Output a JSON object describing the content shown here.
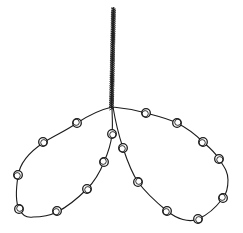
{
  "figure": {
    "background_color": "#ffffff",
    "ink_color": "#1c1c1c",
    "canvas": {
      "width": 243,
      "height": 233
    },
    "stem": {
      "x_top": 113.5,
      "y_top": 8,
      "x_bottom": 111.5,
      "y_bottom": 107,
      "width": 4,
      "texture": "twisted-cord"
    },
    "loops": [
      {
        "name": "left-loop",
        "bead_count": 8,
        "path": "M 112 107 C 99 110 86 117 77 123 C 64 132 53 136 43 143 C 31 151 20 162 18 176 C 16 189 15 201 19 209 C 22 215 27 218 33 217 C 41 217 49 216 57 212 C 69 206 78 198 87 189 C 95 181 100 172 104 162 C 108 153 111 144 112 134 C 113 125 112 115 112 107"
      },
      {
        "name": "right-loop",
        "bead_count": 9,
        "path": "M 113 107 C 124 108 135 110 146 113 C 157 116 167 118 177 123 C 187 128 196 135 203 142 C 210 148 215 152 219 159 C 225 168 228 172 228 180 C 228 188 227 193 223 198 C 217 206 208 215 198 219 C 189 223 177 219 167 211 C 156 202 146 193 138 182 C 131 172 127 160 123 148 C 119 136 115 119 113 107"
      }
    ],
    "bead_style": {
      "radius": 4.3,
      "inner_radius": 3.1,
      "inner_offset_x": 0.8,
      "inner_offset_y": 0.7,
      "stroke_width": 1.3,
      "inner_stroke_width": 0.9,
      "fill": "#ffffff"
    },
    "beads": [
      {
        "loop": "left",
        "x": 77,
        "y": 123
      },
      {
        "loop": "left",
        "x": 43,
        "y": 142
      },
      {
        "loop": "left",
        "x": 18,
        "y": 175
      },
      {
        "loop": "left",
        "x": 19,
        "y": 209
      },
      {
        "loop": "left",
        "x": 57,
        "y": 211
      },
      {
        "loop": "left",
        "x": 87,
        "y": 189
      },
      {
        "loop": "left",
        "x": 104,
        "y": 162
      },
      {
        "loop": "left",
        "x": 112,
        "y": 134
      },
      {
        "loop": "right",
        "x": 146,
        "y": 113
      },
      {
        "loop": "right",
        "x": 177,
        "y": 123
      },
      {
        "loop": "right",
        "x": 203,
        "y": 142
      },
      {
        "loop": "right",
        "x": 219,
        "y": 159
      },
      {
        "loop": "right",
        "x": 223,
        "y": 198
      },
      {
        "loop": "right",
        "x": 198,
        "y": 219
      },
      {
        "loop": "right",
        "x": 167,
        "y": 211
      },
      {
        "loop": "right",
        "x": 138,
        "y": 182
      },
      {
        "loop": "right",
        "x": 123,
        "y": 148
      }
    ]
  }
}
